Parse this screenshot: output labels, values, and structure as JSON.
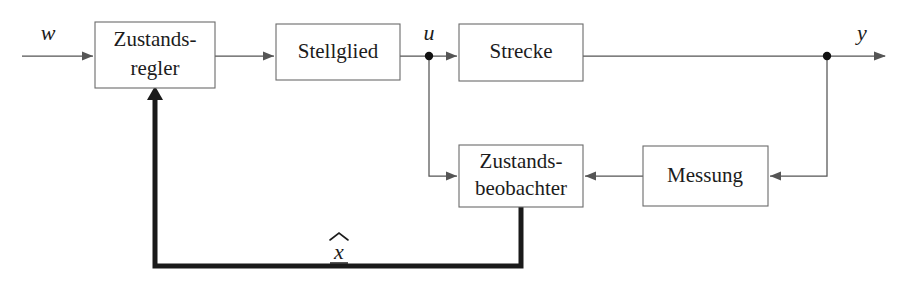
{
  "diagram": {
    "type": "control-block-diagram",
    "background_color": "#ffffff",
    "line_color": "#555555",
    "bold_line_color": "#1a1a1a",
    "box_stroke_color": "#6b6b6b",
    "text_color": "#1c1c1c",
    "blocks": [
      {
        "id": "zustandsregler",
        "label_line1": "Zustands-",
        "label_line2": "regler",
        "x": 95,
        "y": 22,
        "width": 120,
        "height": 66
      },
      {
        "id": "stellglied",
        "label_line1": "Stellglied",
        "label_line2": "",
        "x": 276,
        "y": 24,
        "width": 124,
        "height": 56
      },
      {
        "id": "strecke",
        "label_line1": "Strecke",
        "label_line2": "",
        "x": 459,
        "y": 24,
        "width": 124,
        "height": 57
      },
      {
        "id": "zustandsbeobachter",
        "label_line1": "Zustands-",
        "label_line2": "beobachter",
        "x": 459,
        "y": 145,
        "width": 124,
        "height": 62
      },
      {
        "id": "messung",
        "label_line1": "Messung",
        "label_line2": "",
        "x": 643,
        "y": 146,
        "width": 125,
        "height": 60
      }
    ],
    "signals": [
      {
        "id": "w",
        "label": "w",
        "x": 48,
        "y": 40,
        "description": "Fuehrungsgroesse Eingang"
      },
      {
        "id": "u",
        "label": "u",
        "x": 429,
        "y": 40,
        "description": "Stellgroesse"
      },
      {
        "id": "y",
        "label": "y",
        "x": 862,
        "y": 40,
        "description": "Regelgroesse Ausgang"
      },
      {
        "id": "xhat",
        "label": "x",
        "hat": true,
        "underline": true,
        "x": 339,
        "y": 256,
        "description": "Geschaetzter Zustandsvektor"
      }
    ],
    "junctions": [
      {
        "id": "u-junction",
        "x": 429,
        "y": 56
      },
      {
        "id": "y-junction",
        "x": 827,
        "y": 56
      }
    ],
    "paths": {
      "w_to_regler": "M 22 56 L 93 56",
      "regler_to_stellglied": "M 215 56 L 274 56",
      "stellglied_to_strecke": "M 400 56 L 457 56",
      "strecke_to_y": "M 583 56 L 885 56",
      "u_down_to_observer": "M 429 56 L 429 176 L 457 176",
      "y_down_to_messung": "M 827 56 L 827 176 L 770 176",
      "messung_to_observer": "M 643 176 L 585 176",
      "observer_feedback_bold": "M 521 207 L 521 266 L 155 266 L 155 92"
    },
    "arrowheads": [
      {
        "id": "arrow-into-regler",
        "x": 93,
        "y": 56,
        "dir": "right"
      },
      {
        "id": "arrow-into-stellglied",
        "x": 274,
        "y": 56,
        "dir": "right"
      },
      {
        "id": "arrow-into-strecke",
        "x": 457,
        "y": 56,
        "dir": "right"
      },
      {
        "id": "arrow-y-out",
        "x": 885,
        "y": 56,
        "dir": "right"
      },
      {
        "id": "arrow-into-observer-left",
        "x": 457,
        "y": 176,
        "dir": "right"
      },
      {
        "id": "arrow-into-observer-right",
        "x": 585,
        "y": 176,
        "dir": "left"
      },
      {
        "id": "arrow-into-messung",
        "x": 770,
        "y": 176,
        "dir": "left"
      },
      {
        "id": "arrow-into-regler-bottom",
        "x": 155,
        "y": 90,
        "dir": "up"
      }
    ]
  }
}
